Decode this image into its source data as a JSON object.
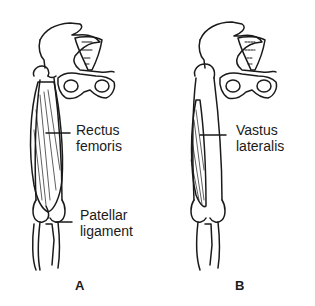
{
  "figure": {
    "panels": [
      {
        "id": "A",
        "letter": "A",
        "labels": [
          {
            "line1": "Rectus",
            "line2": "femoris"
          },
          {
            "line1": "Patellar",
            "line2": "ligament"
          }
        ]
      },
      {
        "id": "B",
        "letter": "B",
        "labels": [
          {
            "line1": "Vastus",
            "line2": "lateralis"
          }
        ]
      }
    ],
    "colors": {
      "ink": "#1a1a1a",
      "background": "#ffffff"
    }
  }
}
